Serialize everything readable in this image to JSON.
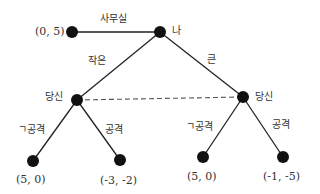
{
  "diagram": {
    "type": "game-tree",
    "nodes": {
      "root": {
        "label": "나"
      },
      "office_terminal": {
        "payoff": "(0, 5)"
      },
      "you_left": {
        "label": "당신"
      },
      "you_right": {
        "label": "당신"
      },
      "t1": {
        "payoff": "(5, 0)"
      },
      "t2": {
        "payoff": "(-3, -2)"
      },
      "t3": {
        "payoff": "(5, 0)"
      },
      "t4": {
        "payoff": "(-1, -5)"
      }
    },
    "edges": {
      "office": "사무실",
      "small": "작은",
      "large": "큰",
      "left_not_attack": "ㄱ공격",
      "left_attack": "공격",
      "right_not_attack": "ㄱ공격",
      "right_attack": "공격"
    },
    "information_set": "dashed line connecting both 당신 nodes",
    "colors": {
      "node": "#111111",
      "line": "#222222",
      "dashed": "#555555"
    }
  }
}
